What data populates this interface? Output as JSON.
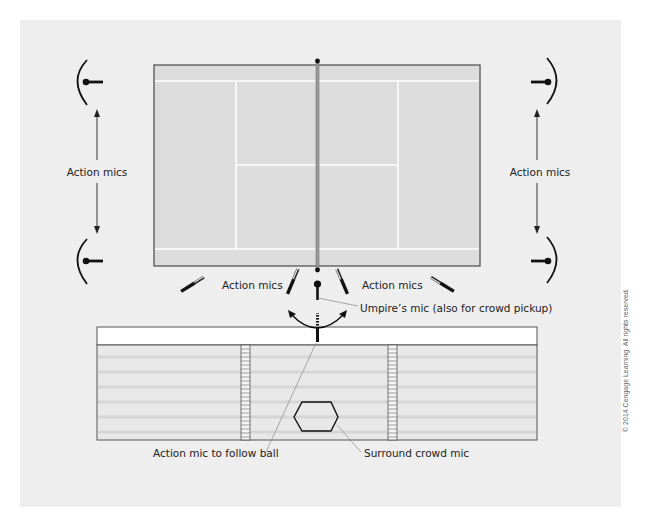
{
  "colors": {
    "panel": "#eeeeee",
    "court": "#dddddd",
    "court_border": "#666666",
    "court_lines": "#ffffff",
    "net": "#9a9a9a",
    "stand_fill": "#e7e7e7",
    "stand_stripe": "#dcdcdc",
    "mic": "#111111",
    "leader_line": "#777777"
  },
  "labels": {
    "action_mics_left": "Action mics",
    "action_mics_right": "Action mics",
    "action_mics_bottom_left": "Action mics",
    "action_mics_bottom_right": "Action mics",
    "umpire_mic": "Umpire’s mic (also for crowd pickup)",
    "action_mic_follow_ball": "Action mic to follow ball",
    "surround_crowd_mic": "Surround crowd mic",
    "copyright": "© 2014 Cengage Learning. All rights reserved."
  },
  "icons": {
    "parabolic_mic": "parabolic-mic-icon",
    "shotgun_mic": "shotgun-mic-icon",
    "umpire_mic": "umpire-mic-icon",
    "surround_mic": "hexagon-surround-mic-icon"
  }
}
